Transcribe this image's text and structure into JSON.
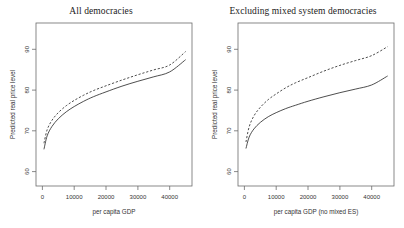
{
  "chart_data": [
    {
      "type": "line",
      "title": "All democracies",
      "xlabel": "per capita GDP",
      "ylabel": "Predicted real price level",
      "xlim": [
        -2000,
        47000
      ],
      "ylim": [
        55,
        95
      ],
      "xticks": [
        0,
        10000,
        20000,
        30000,
        40000
      ],
      "xtick_labels": [
        "0",
        "10000",
        "20000",
        "30000",
        "40000"
      ],
      "yticks": [
        60,
        70,
        80,
        90
      ],
      "ytick_labels": [
        "60",
        "70",
        "80",
        "90"
      ],
      "grid": false,
      "legend": "none",
      "series": [
        {
          "name": "solid",
          "style": "solid",
          "x": [
            500,
            1500,
            3000,
            5000,
            7500,
            10000,
            13000,
            16000,
            20000,
            25000,
            30000,
            35000,
            40000,
            45000
          ],
          "y": [
            64.0,
            67.3,
            69.6,
            71.5,
            73.2,
            74.5,
            75.8,
            76.9,
            78.1,
            79.5,
            80.7,
            81.8,
            83.0,
            86.0
          ]
        },
        {
          "name": "dashed",
          "style": "dashed",
          "x": [
            500,
            1500,
            3000,
            5000,
            7500,
            10000,
            13000,
            16000,
            20000,
            25000,
            30000,
            35000,
            40000,
            45000
          ],
          "y": [
            65.5,
            68.8,
            71.1,
            73.0,
            74.7,
            76.0,
            77.3,
            78.4,
            79.6,
            81.0,
            82.3,
            83.5,
            84.7,
            88.0
          ]
        }
      ]
    },
    {
      "type": "line",
      "title": "Excluding mixed system democracies",
      "xlabel": "per capita GDP (no mixed ES)",
      "ylabel": "Predicted real price level",
      "xlim": [
        -2000,
        47000
      ],
      "ylim": [
        55,
        95
      ],
      "xticks": [
        0,
        10000,
        20000,
        30000,
        40000
      ],
      "xtick_labels": [
        "0",
        "10000",
        "20000",
        "30000",
        "40000"
      ],
      "yticks": [
        60,
        70,
        80,
        90
      ],
      "ytick_labels": [
        "60",
        "70",
        "80",
        "90"
      ],
      "grid": false,
      "legend": "none",
      "series": [
        {
          "name": "solid",
          "style": "solid",
          "x": [
            500,
            1500,
            3000,
            5000,
            7500,
            10000,
            13000,
            16000,
            20000,
            25000,
            30000,
            35000,
            40000,
            45000
          ],
          "y": [
            64.2,
            67.0,
            69.0,
            70.6,
            72.0,
            73.0,
            74.0,
            74.8,
            75.8,
            76.9,
            77.9,
            78.8,
            79.8,
            82.0
          ]
        },
        {
          "name": "dashed",
          "style": "dashed",
          "x": [
            500,
            1500,
            3000,
            5000,
            7500,
            10000,
            13000,
            16000,
            20000,
            25000,
            30000,
            35000,
            40000,
            45000
          ],
          "y": [
            65.8,
            69.5,
            72.2,
            74.3,
            76.2,
            77.6,
            79.1,
            80.3,
            81.6,
            83.2,
            84.6,
            85.8,
            87.0,
            89.2
          ]
        }
      ]
    }
  ],
  "panels": [
    {
      "title": "All democracies",
      "xlabel": "per capita GDP",
      "ylabel": "Predicted real price level",
      "xtick_labels": [
        "0",
        "10000",
        "20000",
        "30000",
        "40000"
      ],
      "ytick_labels": [
        "60",
        "70",
        "80",
        "90"
      ]
    },
    {
      "title": "Excluding mixed system democracies",
      "xlabel": "per capita GDP (no mixed ES)",
      "ylabel": "Predicted real price level",
      "xtick_labels": [
        "0",
        "10000",
        "20000",
        "30000",
        "40000"
      ],
      "ytick_labels": [
        "60",
        "70",
        "80",
        "90"
      ]
    }
  ]
}
